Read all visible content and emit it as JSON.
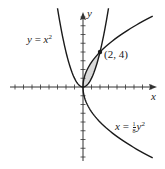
{
  "chart_data": {
    "type": "line",
    "title": "",
    "xlabel": "x",
    "ylabel": "y",
    "xlim": [
      -8,
      8.5
    ],
    "ylim": [
      -8,
      8.5
    ],
    "grid": false,
    "ticks": {
      "x_count_each_side": 8,
      "y_count_each_side": 8,
      "tick_labels": false
    },
    "series": [
      {
        "name": "y = x^2",
        "equation": "y = x^2",
        "x_range": [
          -3,
          3
        ]
      },
      {
        "name": "x = (1/8)y^2",
        "equation": "x = (1/8) y^2",
        "y_range": [
          -8.1,
          8.1
        ]
      }
    ],
    "shaded_region": {
      "between": [
        "y = x^2",
        "x = (1/8)y^2"
      ],
      "x_range": [
        0,
        2
      ],
      "fill": "#d9d9d9"
    },
    "intersection_points": [
      {
        "x": 0,
        "y": 0
      },
      {
        "x": 2,
        "y": 4,
        "label": "(2, 4)"
      }
    ],
    "annotations": [
      {
        "text": "y = x²",
        "position": "upper-left"
      },
      {
        "text": "(2, 4)",
        "position": "near intersection"
      },
      {
        "text": "x = ⅛y²",
        "position": "lower-right"
      }
    ]
  },
  "labels": {
    "curve1": {
      "lhs": "y",
      "eq": " = ",
      "rhs": "x",
      "exp": "2"
    },
    "curve2": {
      "lhs": "x",
      "eq": " = ",
      "frac_num": "1",
      "frac_den": "8",
      "var": "y",
      "exp": "2"
    },
    "point": "(2, 4)",
    "x_axis": "x",
    "y_axis": "y"
  },
  "colors": {
    "curve": "#1a1a1a",
    "axis": "#333333",
    "fill": "#d9d9d9"
  }
}
